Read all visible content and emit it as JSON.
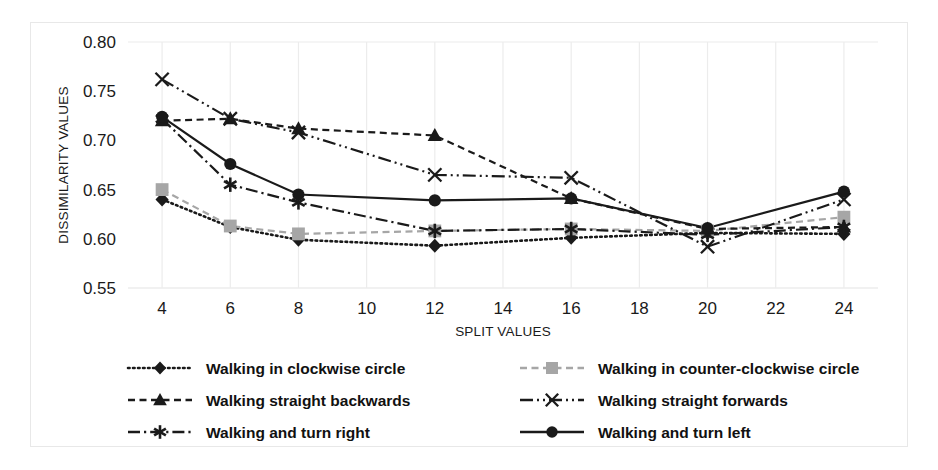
{
  "chart_data": {
    "type": "line",
    "title": "",
    "xlabel": "SPLIT VALUES",
    "ylabel": "DISSIMILARITY VALUES",
    "x": [
      4,
      6,
      8,
      12,
      16,
      20,
      24
    ],
    "xticks": [
      4,
      6,
      8,
      10,
      12,
      14,
      16,
      18,
      20,
      22,
      24
    ],
    "yticks": [
      0.55,
      0.6,
      0.65,
      0.7,
      0.75,
      0.8
    ],
    "xlim": [
      3,
      25
    ],
    "ylim": [
      0.55,
      0.8
    ],
    "grid": "vertical-only",
    "legend_position": "bottom",
    "series": [
      {
        "name": "Walking in clockwise circle",
        "marker": "diamond",
        "marker_fill": "#1a1a1a",
        "line_style": "dotted",
        "color": "#1a1a1a",
        "values": [
          0.64,
          0.612,
          0.599,
          0.593,
          0.601,
          0.606,
          0.605
        ]
      },
      {
        "name": "Walking in counter-clockwise circle",
        "marker": "square",
        "marker_fill": "#a6a6a6",
        "line_style": "dashed",
        "color": "#a6a6a6",
        "values": [
          0.65,
          0.613,
          0.605,
          0.608,
          0.61,
          0.608,
          0.622
        ]
      },
      {
        "name": "Walking straight backwards",
        "marker": "triangle",
        "marker_fill": "#1a1a1a",
        "line_style": "dashed",
        "color": "#1a1a1a",
        "values": [
          0.72,
          0.722,
          0.712,
          0.705,
          0.641,
          0.61,
          0.612
        ]
      },
      {
        "name": "Walking straight forwards",
        "marker": "x",
        "marker_fill": "#1a1a1a",
        "line_style": "dashdotdot",
        "color": "#1a1a1a",
        "values": [
          0.762,
          0.722,
          0.708,
          0.665,
          0.662,
          0.592,
          0.64
        ]
      },
      {
        "name": "Walking and turn right",
        "marker": "asterisk",
        "marker_fill": "#1a1a1a",
        "line_style": "dashdot",
        "color": "#1a1a1a",
        "values": [
          0.722,
          0.655,
          0.637,
          0.608,
          0.61,
          0.604,
          0.612
        ]
      },
      {
        "name": "Walking and turn left",
        "marker": "circle",
        "marker_fill": "#1a1a1a",
        "line_style": "solid",
        "color": "#1a1a1a",
        "values": [
          0.724,
          0.676,
          0.645,
          0.639,
          0.641,
          0.611,
          0.648
        ]
      }
    ]
  },
  "axes": {
    "ylabel": "DISSIMILARITY VALUES",
    "xlabel": "SPLIT VALUES",
    "ytick_labels": [
      "0.80",
      "0.75",
      "0.70",
      "0.65",
      "0.60",
      "0.55"
    ],
    "xtick_labels": [
      "4",
      "6",
      "8",
      "10",
      "12",
      "14",
      "16",
      "18",
      "20",
      "22",
      "24"
    ]
  },
  "legend": {
    "entries": [
      {
        "label": "Walking in clockwise circle",
        "marker": "diamond",
        "line_style": "dotted"
      },
      {
        "label": "Walking in counter-clockwise circle",
        "marker": "square",
        "line_style": "dashed"
      },
      {
        "label": "Walking straight backwards",
        "marker": "triangle",
        "line_style": "dashed"
      },
      {
        "label": "Walking straight forwards",
        "marker": "x",
        "line_style": "solid"
      },
      {
        "label": "Walking and turn right",
        "marker": "asterisk",
        "line_style": "dashdot"
      },
      {
        "label": "Walking and turn left",
        "marker": "circle",
        "line_style": "solid"
      }
    ]
  },
  "colors": {
    "ink": "#1a1a1a",
    "gray_marker": "#a6a6a6",
    "gridline": "#ececec",
    "border": "#e8e8e8",
    "background": "#ffffff"
  }
}
